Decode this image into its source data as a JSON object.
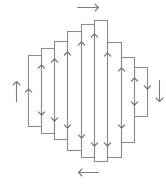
{
  "diagram": {
    "type": "boustrophedon-column-path",
    "stroke_color": "#8c8c8c",
    "arrow_color": "#6e6e6e",
    "vertical_lines_x": [
      28,
      41,
      54,
      67,
      81,
      94,
      107,
      121,
      134,
      147
    ],
    "bands": [
      {
        "x1": 28,
        "x2": 41,
        "top": 55,
        "bottom": 126
      },
      {
        "x1": 41,
        "x2": 54,
        "top": 48,
        "bottom": 133
      },
      {
        "x1": 54,
        "x2": 67,
        "top": 41,
        "bottom": 139
      },
      {
        "x1": 67,
        "x2": 81,
        "top": 31,
        "bottom": 150
      },
      {
        "x1": 81,
        "x2": 94,
        "top": 24,
        "bottom": 157
      },
      {
        "x1": 94,
        "x2": 107,
        "top": 20,
        "bottom": 161
      },
      {
        "x1": 107,
        "x2": 121,
        "top": 42,
        "bottom": 157
      },
      {
        "x1": 121,
        "x2": 134,
        "top": 57,
        "bottom": 142
      },
      {
        "x1": 134,
        "x2": 147,
        "top": 67,
        "bottom": 116
      }
    ],
    "inner_arrows": [
      {
        "x": 28,
        "y": 89,
        "dir": "up"
      },
      {
        "x": 41,
        "y": 65,
        "dir": "up"
      },
      {
        "x": 41,
        "y": 115,
        "dir": "down"
      },
      {
        "x": 54,
        "y": 59,
        "dir": "up"
      },
      {
        "x": 54,
        "y": 121,
        "dir": "down"
      },
      {
        "x": 67,
        "y": 52,
        "dir": "up"
      },
      {
        "x": 67,
        "y": 128,
        "dir": "down"
      },
      {
        "x": 81,
        "y": 42,
        "dir": "up"
      },
      {
        "x": 81,
        "y": 138,
        "dir": "down"
      },
      {
        "x": 94,
        "y": 34,
        "dir": "up"
      },
      {
        "x": 94,
        "y": 146,
        "dir": "down"
      },
      {
        "x": 107,
        "y": 53,
        "dir": "up"
      },
      {
        "x": 107,
        "y": 146,
        "dir": "down"
      },
      {
        "x": 121,
        "y": 68,
        "dir": "up"
      },
      {
        "x": 121,
        "y": 128,
        "dir": "down"
      },
      {
        "x": 134,
        "y": 78,
        "dir": "up"
      },
      {
        "x": 134,
        "y": 105,
        "dir": "down"
      },
      {
        "x": 147,
        "y": 89,
        "dir": "down"
      }
    ],
    "outer_arrows": [
      {
        "name": "top-arrow-right",
        "x1": 77,
        "y1": 7,
        "x2": 98,
        "y2": 7,
        "dir": "right"
      },
      {
        "name": "bottom-arrow-left",
        "x1": 98,
        "y1": 172,
        "x2": 78,
        "y2": 172,
        "dir": "left"
      },
      {
        "name": "left-arrow-up",
        "x1": 16,
        "y1": 101,
        "x2": 16,
        "y2": 81,
        "dir": "up"
      },
      {
        "name": "right-arrow-down",
        "x1": 159,
        "y1": 80,
        "x2": 159,
        "y2": 101,
        "dir": "down"
      }
    ]
  }
}
